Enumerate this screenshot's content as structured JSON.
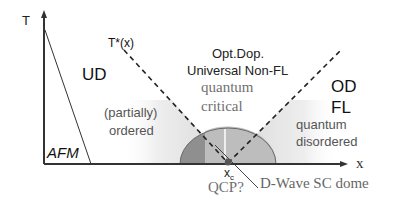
{
  "diagram": {
    "axes": {
      "y_label": "T",
      "x_label": "x"
    },
    "regions": {
      "afm": "AFM",
      "ud": "UD",
      "partially_ordered_line1": "(partially)",
      "partially_ordered_line2": "ordered",
      "opt_dop_line1": "Opt.Dop.",
      "opt_dop_line2": "Universal Non-FL",
      "quantum_critical_line1": "quantum",
      "quantum_critical_line2": "critical",
      "od_line1": "OD",
      "od_line2": "FL",
      "quantum_disordered_line1": "quantum",
      "quantum_disordered_line2": "disordered"
    },
    "annotations": {
      "t_star": "T*(x)",
      "xc_main": "x",
      "xc_sub": "c",
      "qcp": "QCP?",
      "dome": "D-Wave SC dome"
    },
    "colors": {
      "axis": "#333333",
      "dome_dark": "#8a8a8a",
      "dome_light": "#b8b8b8",
      "shade": "#e2e2e2",
      "text_sans": "#222222",
      "text_serif": "#707070"
    }
  }
}
